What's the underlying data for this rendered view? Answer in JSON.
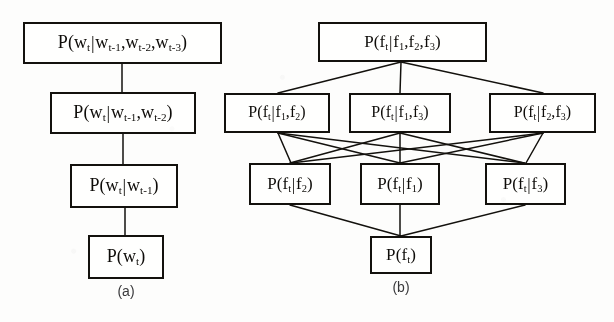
{
  "figure": {
    "background_color": "#fbfbfa",
    "line_color": "#15130f",
    "text_color": "#100e0b",
    "caption_color": "#3a3a3c"
  },
  "panel_a": {
    "caption": "(a)",
    "nodes": [
      {
        "id": "a1",
        "label": "P(w_t|w_{t-1},w_{t-2},w_{t-3})",
        "x": 23,
        "y": 22,
        "w": 199,
        "h": 42
      },
      {
        "id": "a2",
        "label": "P(w_t|w_{t-1},w_{t-2})",
        "x": 50,
        "y": 92,
        "w": 146,
        "h": 42
      },
      {
        "id": "a3",
        "label": "P(w_t|w_{t-1})",
        "x": 70,
        "y": 164,
        "w": 108,
        "h": 44
      },
      {
        "id": "a4",
        "label": "P(w_t)",
        "x": 88,
        "y": 235,
        "w": 76,
        "h": 44
      }
    ],
    "edges": [
      {
        "from": "a1",
        "to": "a2"
      },
      {
        "from": "a2",
        "to": "a3"
      },
      {
        "from": "a3",
        "to": "a4"
      }
    ]
  },
  "panel_b": {
    "caption": "(b)",
    "nodes": [
      {
        "id": "b0",
        "label": "P(f_t|f_1,f_2,f_3)",
        "x": 318,
        "y": 22,
        "w": 169,
        "h": 40
      },
      {
        "id": "b12",
        "label": "P(f_t|f_1,f_2)",
        "x": 224,
        "y": 93,
        "w": 106,
        "h": 40
      },
      {
        "id": "b13",
        "label": "P(f_t|f_1,f_3)",
        "x": 349,
        "y": 93,
        "w": 102,
        "h": 40
      },
      {
        "id": "b23",
        "label": "P(f_t|f_2,f_3)",
        "x": 489,
        "y": 93,
        "w": 107,
        "h": 40
      },
      {
        "id": "b2",
        "label": "P(f_t|f_2)",
        "x": 249,
        "y": 163,
        "w": 82,
        "h": 42
      },
      {
        "id": "b1",
        "label": "P(f_t|f_1)",
        "x": 360,
        "y": 163,
        "w": 80,
        "h": 42
      },
      {
        "id": "b3",
        "label": "P(f_t|f_3)",
        "x": 485,
        "y": 163,
        "w": 81,
        "h": 42
      },
      {
        "id": "bt",
        "label": "P(f_t)",
        "x": 370,
        "y": 236,
        "w": 62,
        "h": 38
      }
    ],
    "edges": [
      {
        "from": "b0",
        "to": "b12"
      },
      {
        "from": "b0",
        "to": "b13"
      },
      {
        "from": "b0",
        "to": "b23"
      },
      {
        "from": "b12",
        "to": "b1"
      },
      {
        "from": "b12",
        "to": "b2"
      },
      {
        "from": "b13",
        "to": "b1"
      },
      {
        "from": "b13",
        "to": "b3"
      },
      {
        "from": "b23",
        "to": "b2"
      },
      {
        "from": "b23",
        "to": "b3"
      },
      {
        "from": "b2",
        "to": "bt"
      },
      {
        "from": "b1",
        "to": "bt"
      },
      {
        "from": "b3",
        "to": "bt"
      }
    ]
  }
}
